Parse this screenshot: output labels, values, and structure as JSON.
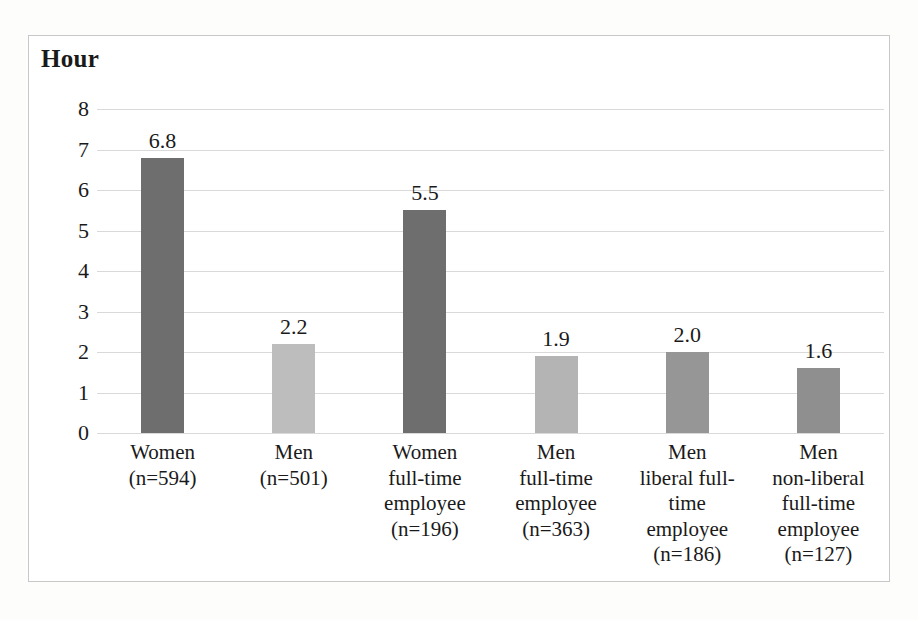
{
  "chart_data": {
    "type": "bar",
    "title": "Hour",
    "xlabel": "",
    "ylabel": "Hour",
    "ylim": [
      0,
      8
    ],
    "yticks": [
      "0",
      "1",
      "2",
      "3",
      "4",
      "5",
      "6",
      "7",
      "8"
    ],
    "grid": true,
    "legend": "none",
    "categories": [
      "Women\n(n=594)",
      "Men\n(n=501)",
      "Women\nfull-time\nemployee\n(n=196)",
      "Men\nfull-time\nemployee\n(n=363)",
      "Men\nliberal full-\ntime\nemployee\n(n=186)",
      "Men\nnon-liberal\nfull-time\nemployee\n(n=127)"
    ],
    "values": [
      6.8,
      2.2,
      5.5,
      1.9,
      2.0,
      1.6
    ],
    "value_labels": [
      "6.8",
      "2.2",
      "5.5",
      "1.9",
      "2.0",
      "1.6"
    ],
    "bar_colors": [
      "#6e6e6e",
      "#bdbdbd",
      "#6e6e6e",
      "#b4b4b4",
      "#969696",
      "#8f8f8f"
    ],
    "group_sizes": [
      594,
      501,
      196,
      363,
      186,
      127
    ]
  },
  "axis_title": "Hour"
}
